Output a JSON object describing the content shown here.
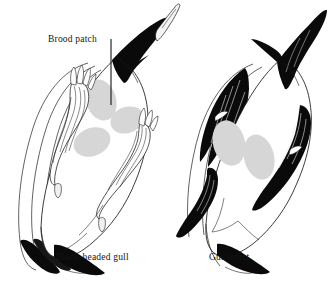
{
  "figure": {
    "background_color": "#ffffff",
    "annotation": {
      "label": "Brood patch",
      "leader_line": "vertical-pointer"
    },
    "species": [
      {
        "id": "black-headed-gull",
        "label": "Black-headed gull",
        "position": "left",
        "plumage": "white body with dark hood and outlined pale wings",
        "brood_patch_count": 3,
        "brood_patch_arrangement": "triangular",
        "brood_patch_color": "#d6d6d6"
      },
      {
        "id": "guillemot",
        "label": "Guillemot",
        "position": "right",
        "plumage": "white underside with solid black head and wings",
        "brood_patch_count": 2,
        "brood_patch_arrangement": "paired side-by-side",
        "brood_patch_color": "#d6d6d6"
      }
    ],
    "colors": {
      "ink": "#000000",
      "outline": "#1a1a1a",
      "brood_patch": "#d6d6d6",
      "body_fill": "#ffffff",
      "text": "#141414"
    }
  }
}
